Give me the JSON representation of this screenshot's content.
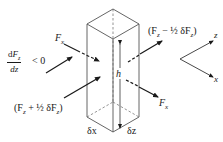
{
  "diagram": {
    "type": "force-balance on vertical fluid column element",
    "labels": {
      "gradient_num": "dF_z",
      "gradient_den": "dz",
      "gradient_condition": "< 0",
      "fx_left": "F",
      "fx_left_sub": "x",
      "fx_right": "F",
      "fx_right_sub": "x",
      "fz_in": "(F",
      "fz_in_sub": "z",
      "fz_in_rest": " + ½ δF",
      "fz_in_sub2": "z",
      "fz_in_close": ")",
      "fz_out": "(F",
      "fz_out_sub": "z",
      "fz_out_rest": " − ½ δF",
      "fz_out_sub2": "z",
      "fz_out_close": ")",
      "height": "h",
      "width_x": "δx",
      "width_z": "δz",
      "axis_z": "z",
      "axis_x": "x"
    },
    "colors": {
      "line": "#555555",
      "arrow": "#1a1a1a"
    }
  }
}
